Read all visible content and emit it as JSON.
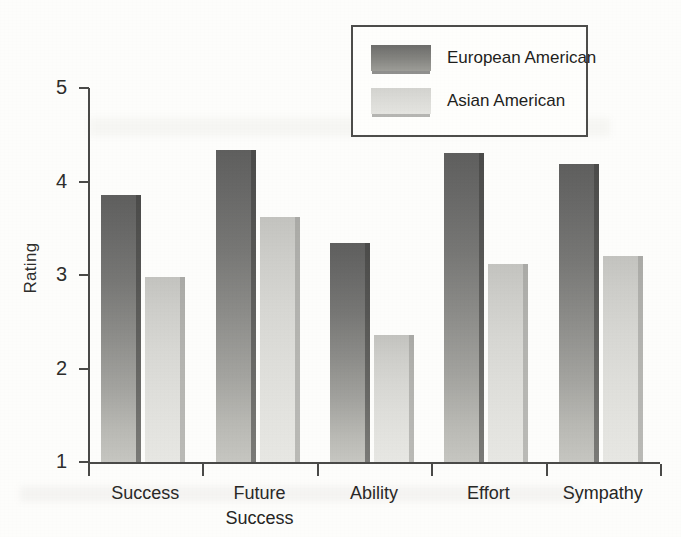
{
  "chart_data": {
    "type": "bar",
    "title": "",
    "subtitle": "",
    "xlabel": "",
    "ylabel": "Rating",
    "categories": [
      "Success",
      "Future\nSuccess",
      "Ability",
      "Effort",
      "Sympathy"
    ],
    "series": [
      {
        "name": "European American",
        "color": "#7c7c79",
        "values": [
          3.86,
          4.34,
          3.34,
          4.3,
          4.19
        ]
      },
      {
        "name": "Asian American",
        "color": "#dcdcd8",
        "values": [
          2.98,
          3.62,
          2.36,
          3.12,
          3.2
        ]
      }
    ],
    "ylim": [
      1,
      5
    ],
    "ytick_labels": [
      "5",
      "4",
      "3",
      "2",
      "1"
    ],
    "ytick_values": [
      5,
      4,
      3,
      2,
      1
    ],
    "grid": false,
    "legend_position": "top-right",
    "annotations": []
  },
  "legend": {
    "entries": [
      {
        "label": "European American",
        "swatch": "dark-gray-gradient-swatch"
      },
      {
        "label": "Asian American",
        "swatch": "light-gray-gradient-swatch"
      }
    ]
  },
  "axes": {
    "y_title": "Rating",
    "y_ticks": [
      "5",
      "4",
      "3",
      "2",
      "1"
    ],
    "x_categories": [
      "Success",
      "Future\nSuccess",
      "Ability",
      "Effort",
      "Sympathy"
    ]
  }
}
